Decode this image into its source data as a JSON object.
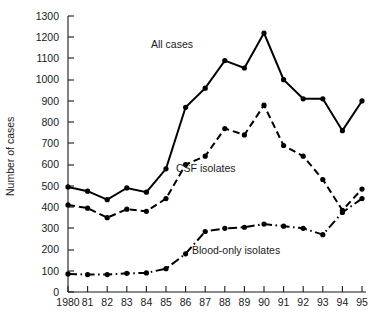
{
  "chart_data": {
    "type": "line",
    "title": "",
    "xlabel": "",
    "ylabel": "Number of cases",
    "ylim": [
      0,
      1300
    ],
    "ytick_step": 100,
    "grid": false,
    "legend": "inline-annotations",
    "categories": [
      "1980",
      "81",
      "82",
      "83",
      "84",
      "85",
      "86",
      "87",
      "88",
      "89",
      "90",
      "91",
      "92",
      "93",
      "94",
      "95"
    ],
    "x_tick_labels": [
      "1980",
      "81",
      "82",
      "83",
      "84",
      "85",
      "86",
      "87",
      "88",
      "89",
      "90",
      "91",
      "92",
      "93",
      "94",
      "95"
    ],
    "y_tick_labels": [
      "0",
      "100",
      "200",
      "300",
      "400",
      "500",
      "600",
      "700",
      "800",
      "900",
      "1000",
      "1100",
      "1200",
      "1300"
    ],
    "y_tick_values": [
      0,
      100,
      200,
      300,
      400,
      500,
      600,
      700,
      800,
      900,
      1000,
      1100,
      1200,
      1300
    ],
    "series": [
      {
        "name": "All cases",
        "label": "All cases",
        "style": "solid",
        "color": "#000000",
        "marker": "filled-circle",
        "values": [
          495,
          475,
          435,
          490,
          470,
          580,
          870,
          960,
          1090,
          1055,
          1220,
          1000,
          910,
          910,
          760,
          900
        ]
      },
      {
        "name": "CSF isolates",
        "label": "CSF isolates",
        "style": "dashed",
        "color": "#000000",
        "marker": "filled-circle",
        "values": [
          410,
          395,
          350,
          390,
          380,
          440,
          600,
          640,
          770,
          740,
          880,
          690,
          640,
          530,
          385,
          485
        ]
      },
      {
        "name": "Blood-only isolates",
        "label": "Blood-only isolates",
        "style": "dash-dot",
        "color": "#000000",
        "marker": "filled-circle",
        "values": [
          85,
          82,
          82,
          88,
          90,
          110,
          180,
          285,
          300,
          305,
          320,
          310,
          300,
          270,
          375,
          440
        ]
      }
    ],
    "annotations": [
      {
        "text": "All cases",
        "x_px": 172,
        "y_px": 48
      },
      {
        "text": "CSF isolates",
        "x_px": 176,
        "y_px": 172
      },
      {
        "text": "Blood-only isolates",
        "x_px": 192,
        "y_px": 254
      }
    ],
    "axis_geometry": {
      "plot_left_px": 68,
      "plot_right_px": 362,
      "y_zero_px": 292,
      "y_top_px": 16,
      "x_step_px": 19.6,
      "y_per_unit_px": 0.2123
    }
  }
}
